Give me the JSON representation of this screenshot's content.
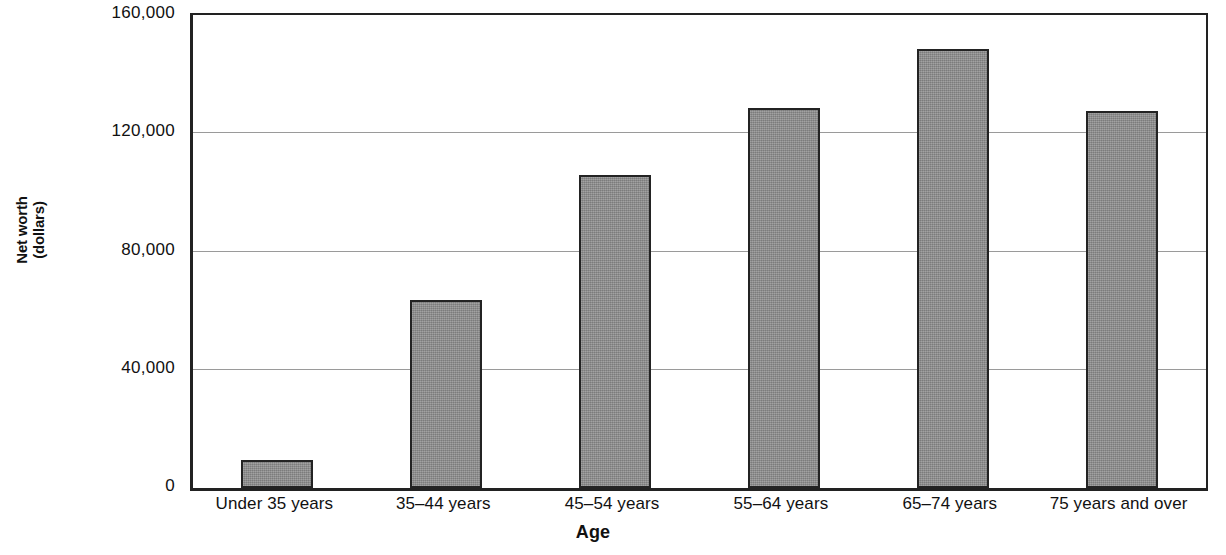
{
  "chart_data": {
    "type": "bar",
    "title": "",
    "xlabel": "Age",
    "ylabel": "Net worth (dollars)",
    "ylabel_line1": "Net worth",
    "ylabel_line2": "(dollars)",
    "categories": [
      "Under 35 years",
      "35–44 years",
      "45–54 years",
      "55–64 years",
      "65–74 years",
      "75 years and over"
    ],
    "values": [
      9400,
      63500,
      106000,
      128500,
      148500,
      127500
    ],
    "ylim": [
      0,
      160000
    ],
    "yticks": [
      0,
      40000,
      80000,
      120000,
      160000
    ],
    "ytick_labels": [
      "0",
      "40,000",
      "80,000",
      "120,000",
      "160,000"
    ],
    "grid": true,
    "grid_axis": "y",
    "legend": false,
    "bar_color": "#8d8d8d",
    "bar_edge_color": "#232323",
    "background_color": "#ffffff"
  }
}
